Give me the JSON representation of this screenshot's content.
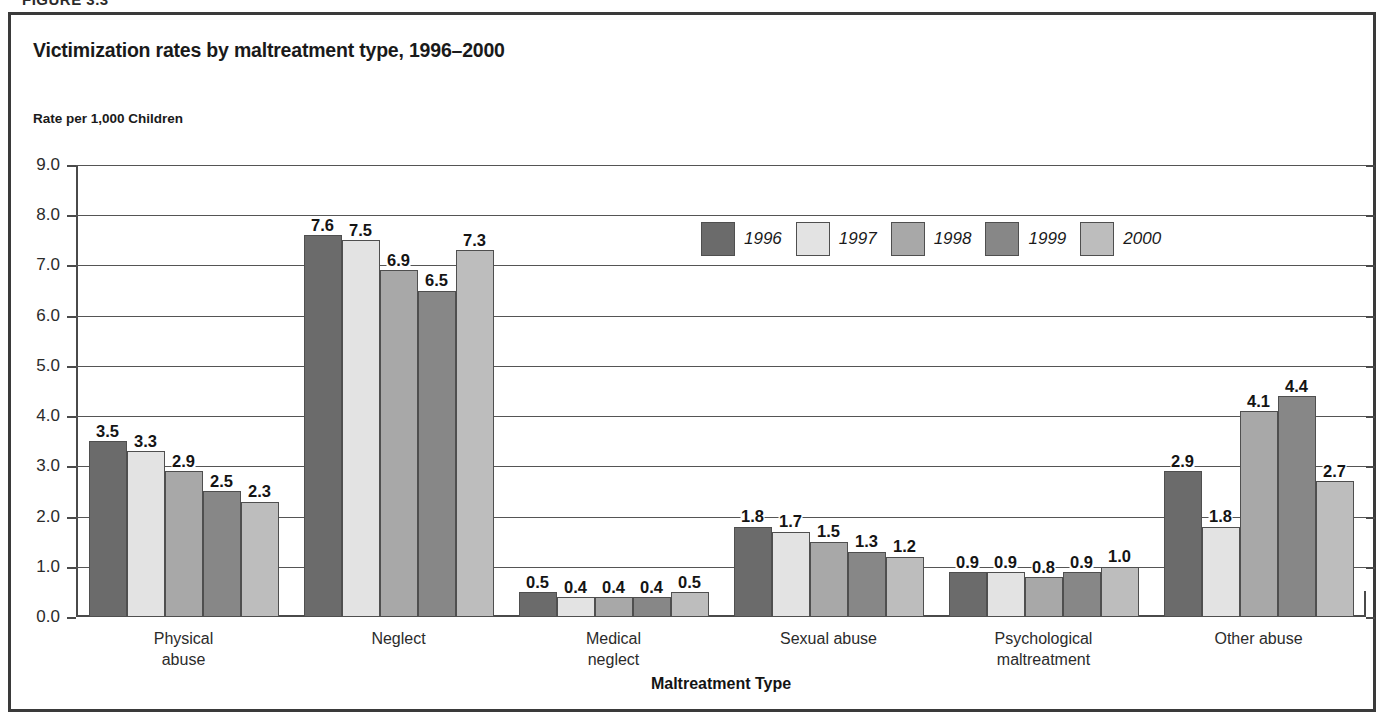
{
  "page": {
    "figure_header": "FIGURE 3.3"
  },
  "chart_data": {
    "type": "bar",
    "title": "Victimization rates by maltreatment type, 1996–2000",
    "ylabel": "Rate per 1,000 Children",
    "xlabel": "Maltreatment Type",
    "ylim": [
      0.0,
      9.0
    ],
    "ytick_step": 1.0,
    "ytick_labels": [
      "0.0",
      "1.0",
      "2.0",
      "3.0",
      "4.0",
      "5.0",
      "6.0",
      "7.0",
      "8.0",
      "9.0"
    ],
    "grid": true,
    "legend_position": "upper center",
    "categories": [
      "Physical abuse",
      "Neglect",
      "Medical neglect",
      "Sexual abuse",
      "Psychological\nmaltreatment",
      "Other abuse"
    ],
    "series": [
      {
        "name": "1996",
        "color": "#6b6b6b",
        "values": [
          3.5,
          7.6,
          0.5,
          1.8,
          0.9,
          2.9
        ],
        "labels": [
          "3.5",
          "7.6",
          "0.5",
          "1.8",
          "0.9",
          "2.9"
        ]
      },
      {
        "name": "1997",
        "color": "#e3e3e3",
        "values": [
          3.3,
          7.5,
          0.4,
          1.7,
          0.9,
          1.8
        ],
        "labels": [
          "3.3",
          "7.5",
          "0.4",
          "1.7",
          "0.9",
          "1.8"
        ]
      },
      {
        "name": "1998",
        "color": "#a8a8a8",
        "values": [
          2.9,
          6.9,
          0.4,
          1.5,
          0.8,
          4.1
        ],
        "labels": [
          "2.9",
          "6.9",
          "0.4",
          "1.5",
          "0.8",
          "4.1"
        ]
      },
      {
        "name": "1999",
        "color": "#878787",
        "values": [
          2.5,
          6.5,
          0.4,
          1.3,
          0.9,
          4.4
        ],
        "labels": [
          "2.5",
          "6.5",
          "0.4",
          "1.3",
          "0.9",
          "4.4"
        ]
      },
      {
        "name": "2000",
        "color": "#bdbdbd",
        "values": [
          2.3,
          7.3,
          0.5,
          1.2,
          1.0,
          2.7
        ],
        "labels": [
          "2.3",
          "7.3",
          "0.5",
          "1.2",
          "1.0",
          "2.7"
        ]
      }
    ]
  }
}
